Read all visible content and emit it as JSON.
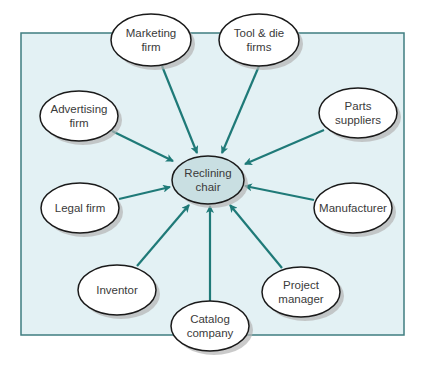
{
  "diagram": {
    "type": "hub-and-spoke",
    "colors": {
      "background_panel": "#e3f1f4",
      "panel_border": "#3f7d80",
      "arrow": "#1f7a78",
      "node_fill": "#ffffff",
      "center_fill": "#c9dfe2",
      "node_stroke": "#1a1a1a",
      "shadow": "#b5b5b5"
    },
    "center": {
      "id": "reclining-chair",
      "lines": [
        "Reclining",
        "chair"
      ]
    },
    "nodes": [
      {
        "id": "marketing-firm",
        "lines": [
          "Marketing",
          "firm"
        ]
      },
      {
        "id": "tool-die-firms",
        "lines": [
          "Tool & die",
          "firms"
        ]
      },
      {
        "id": "advertising-firm",
        "lines": [
          "Advertising",
          "firm"
        ]
      },
      {
        "id": "parts-suppliers",
        "lines": [
          "Parts",
          "suppliers"
        ]
      },
      {
        "id": "legal-firm",
        "lines": [
          "Legal firm"
        ]
      },
      {
        "id": "manufacturer",
        "lines": [
          "Manufacturer"
        ]
      },
      {
        "id": "inventor",
        "lines": [
          "Inventor"
        ]
      },
      {
        "id": "project-manager",
        "lines": [
          "Project",
          "manager"
        ]
      },
      {
        "id": "catalog-company",
        "lines": [
          "Catalog",
          "company"
        ]
      }
    ],
    "edges": [
      {
        "from": "marketing-firm",
        "to": "reclining-chair"
      },
      {
        "from": "tool-die-firms",
        "to": "reclining-chair"
      },
      {
        "from": "advertising-firm",
        "to": "reclining-chair"
      },
      {
        "from": "parts-suppliers",
        "to": "reclining-chair"
      },
      {
        "from": "legal-firm",
        "to": "reclining-chair"
      },
      {
        "from": "manufacturer",
        "to": "reclining-chair"
      },
      {
        "from": "inventor",
        "to": "reclining-chair"
      },
      {
        "from": "project-manager",
        "to": "reclining-chair"
      },
      {
        "from": "catalog-company",
        "to": "reclining-chair"
      }
    ]
  }
}
